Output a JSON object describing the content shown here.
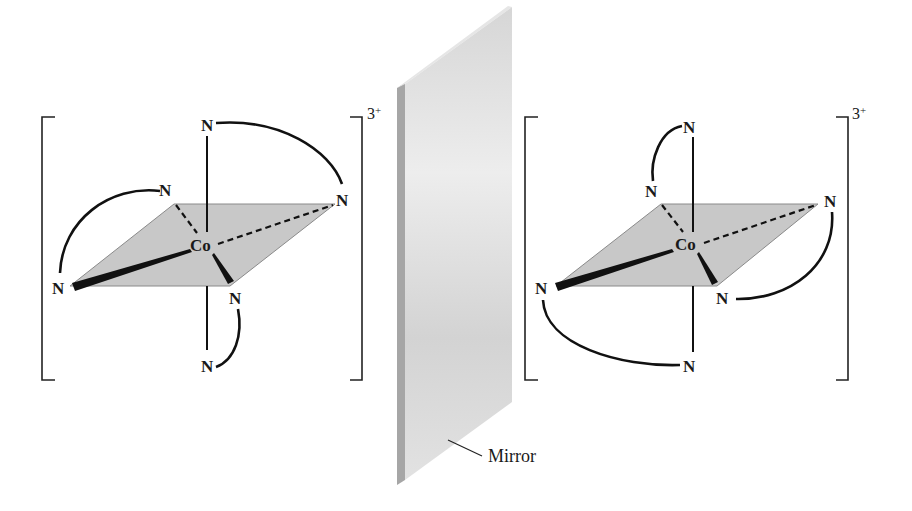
{
  "figure": {
    "mirror_label": "Mirror",
    "left_complex": {
      "metal": "Co",
      "ligand_atom": "N",
      "charge": "3",
      "charge_sign": "+",
      "atoms": {
        "n_top": "N",
        "n_back_left": "N",
        "n_back_right": "N",
        "n_front_left": "N",
        "n_front_right": "N",
        "n_bottom": "N"
      }
    },
    "right_complex": {
      "metal": "Co",
      "ligand_atom": "N",
      "charge": "3",
      "charge_sign": "+",
      "atoms": {
        "n_top": "N",
        "n_back_left": "N",
        "n_back_right": "N",
        "n_front_left": "N",
        "n_front_right": "N",
        "n_bottom": "N"
      }
    },
    "colors": {
      "background": "#ffffff",
      "plane_fill": "#c8c8c8",
      "mirror_face": "#dcdcdc",
      "mirror_edge": "#a6a6a6",
      "ink": "#111111"
    }
  }
}
